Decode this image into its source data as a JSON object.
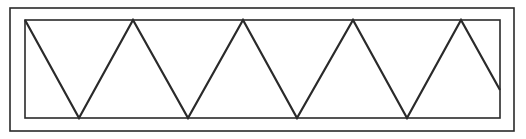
{
  "diagram": {
    "stroke_color": "#2a2a2a",
    "background": "#ffffff",
    "outer_frame": {
      "x": 10,
      "y": 8,
      "width": 504,
      "height": 123
    },
    "inner_frame": {
      "x": 25,
      "y": 20,
      "width": 475,
      "height": 98
    },
    "zigzag_points": [
      [
        25,
        20
      ],
      [
        79,
        118
      ],
      [
        133,
        20
      ],
      [
        188,
        118
      ],
      [
        243,
        20
      ],
      [
        297,
        118
      ],
      [
        353,
        20
      ],
      [
        407,
        118
      ],
      [
        461,
        20
      ],
      [
        500,
        90
      ]
    ]
  }
}
